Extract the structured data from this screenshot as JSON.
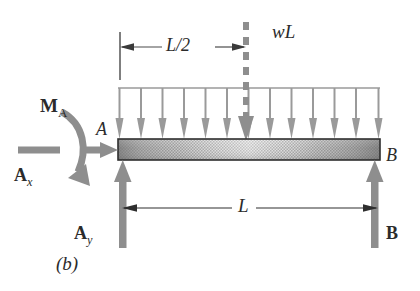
{
  "figure": {
    "caption": "(b)",
    "colors": {
      "force_gray": "#8e8e8e",
      "load_gray": "#9a9a9a",
      "beam_outline": "#2e2e2e",
      "beam_fill_light": "#cfcfcf",
      "beam_fill_dark": "#8a8a8a",
      "dimension_line": "#555555",
      "text": "#2b2b2b"
    }
  },
  "labels": {
    "resultant_load": "wL",
    "half_span": "L/2",
    "span": "L",
    "moment_reaction": "M",
    "moment_reaction_sub": "A",
    "horizontal_reaction": "A",
    "horizontal_reaction_sub": "x",
    "vertical_reaction": "A",
    "vertical_reaction_sub": "y",
    "point_a": "A",
    "point_b": "B",
    "reaction_b": "B"
  },
  "geometry": {
    "beam": {
      "x_left": 118,
      "x_right": 380,
      "y_top": 139,
      "y_bottom": 160
    },
    "load_top_line_y": 88,
    "midspan_x": 246,
    "dim_half_span_y": 47,
    "dim_span_y": 208,
    "distributed_arrow_count": 13
  },
  "elements": {
    "distributed_load_name": "distributed-load-arrows",
    "resultant_name": "resultant-load-dashed-line",
    "beam_name": "beam-body",
    "moment_name": "moment-reaction-arc",
    "ax_name": "horizontal-reaction-arrow",
    "ay_name": "vertical-reaction-arrow-a",
    "b_name": "vertical-reaction-arrow-b"
  }
}
